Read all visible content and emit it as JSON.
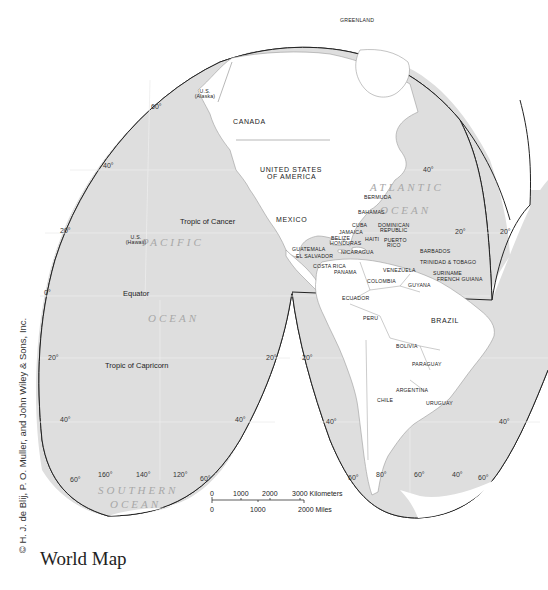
{
  "caption": "World Map",
  "credit": "© H. J. de Blij, P. O. Muller, and John Wiley & Sons, Inc.",
  "colors": {
    "ocean": "#dedede",
    "land": "#ffffff",
    "border": "#222222",
    "ocean_label": "#a8a8a8"
  },
  "oceans": {
    "pacific_1": "PACIFIC",
    "pacific_2": "OCEAN",
    "atlantic_1": "ATLANTIC",
    "atlantic_2": "OCEAN",
    "southern_1": "SOUTHERN",
    "southern_2": "OCEAN"
  },
  "lines": {
    "tropic_cancer": "Tropic of Cancer",
    "equator": "Equator",
    "tropic_capricorn": "Tropic of Capricorn"
  },
  "countries": {
    "greenland": "GREENLAND",
    "us_alaska_1": "U.S.",
    "us_alaska_2": "(Alaska)",
    "canada": "CANADA",
    "usa_1": "UNITED STATES",
    "usa_2": "OF AMERICA",
    "mexico": "MEXICO",
    "us_hawaii_1": "U.S.",
    "us_hawaii_2": "(Hawaii)",
    "bermuda": "BERMUDA",
    "bahamas": "BAHAMAS",
    "cuba": "CUBA",
    "dominican_1": "DOMINICAN",
    "dominican_2": "REPUBLIC",
    "jamaica": "JAMAICA",
    "haiti": "HAITI",
    "puerto_rico_1": "PUERTO",
    "puerto_rico_2": "RICO",
    "belize": "BELIZE",
    "honduras": "HONDURAS",
    "guatemala": "GUATEMALA",
    "el_salvador": "EL SALVADOR",
    "nicaragua": "NICARAGUA",
    "costa_rica": "COSTA RICA",
    "panama": "PANAMA",
    "barbados": "BARBADOS",
    "trinidad": "TRINIDAD & TOBAGO",
    "venezuela": "VENEZUELA",
    "suriname": "SURINAME",
    "french_guiana": "FRENCH GUIANA",
    "guyana": "GUYANA",
    "colombia": "COLOMBIA",
    "ecuador": "ECUADOR",
    "peru": "PERU",
    "brazil": "BRAZIL",
    "bolivia": "BOLIVIA",
    "paraguay": "PARAGUAY",
    "argentina": "ARGENTINA",
    "chile": "CHILE",
    "uruguay": "URUGUAY"
  },
  "latitudes": {
    "n60": "60°",
    "n40": "40°",
    "n20": "20°",
    "eq": "0°",
    "s20": "20°",
    "s40": "40°",
    "s60": "60°",
    "r40": "40°",
    "r20a": "20°",
    "r20b": "20°",
    "m20a": "20°",
    "m20b": "20°",
    "m40a": "40°",
    "m40b": "40°",
    "m60a": "60°",
    "m60b": "60°",
    "rs60": "60°"
  },
  "longitudes": {
    "w160": "160°",
    "w140": "140°",
    "w120": "120°",
    "w80": "80°",
    "w60": "60°",
    "w40": "40°"
  },
  "scale": {
    "km_ticks": [
      "0",
      "1000",
      "2000",
      "3000 Kilometers"
    ],
    "mi_ticks": [
      "0",
      "1000",
      "2000 Miles"
    ]
  }
}
